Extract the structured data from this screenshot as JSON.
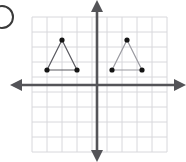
{
  "figure": {
    "kind": "coordinate-plane-with-two-triangles",
    "canvas": {
      "width": 186,
      "height": 162,
      "background": "#ffffff"
    },
    "answer_choice_bubble": {
      "name": "answer-choice-bubble",
      "clipped": true,
      "center_x": 2,
      "center_y": 17,
      "radius": 11,
      "stroke": "#3a3a3a",
      "stroke_width": 2
    },
    "grid": {
      "spacing": 15,
      "left": 32,
      "top": 17,
      "right": 167,
      "bottom": 152,
      "columns": 9,
      "rows": 9,
      "color": "#d8d8dc",
      "stroke_width": 1,
      "visible": true
    },
    "origin": {
      "x": 97,
      "y": 85
    },
    "axes": {
      "color": "#545458",
      "stroke_width": 2.6,
      "x_axis": {
        "name": "x-axis",
        "start_x": 16,
        "end_x": 180,
        "y": 85,
        "arrow_left": true,
        "arrow_right": true
      },
      "y_axis": {
        "name": "y-axis",
        "x": 97,
        "start_y": 6,
        "end_y": 156,
        "arrow_up": true,
        "arrow_down": true
      },
      "arrow_size": 6
    },
    "shapes": [
      {
        "name": "triangle-left",
        "label": "left triangle",
        "stroke": "#5a5a60",
        "stroke_width": 1.2,
        "fill": "none",
        "vertices": [
          {
            "name": "vertex-apex",
            "x": 62,
            "y": 40,
            "grid_x": -2.333,
            "grid_y": 3
          },
          {
            "name": "vertex-base-left",
            "x": 47,
            "y": 70,
            "grid_x": -3.333,
            "grid_y": 1
          },
          {
            "name": "vertex-base-right",
            "x": 77,
            "y": 70,
            "grid_x": -1.333,
            "grid_y": 1
          }
        ]
      },
      {
        "name": "triangle-right",
        "label": "right triangle",
        "stroke": "#9a9aa0",
        "stroke_width": 1.2,
        "fill": "none",
        "vertices": [
          {
            "name": "vertex-apex",
            "x": 127,
            "y": 40,
            "grid_x": 2,
            "grid_y": 3
          },
          {
            "name": "vertex-base-left",
            "x": 112,
            "y": 70,
            "grid_x": 1,
            "grid_y": 1
          },
          {
            "name": "vertex-base-right",
            "x": 142,
            "y": 70,
            "grid_x": 3,
            "grid_y": 1
          }
        ]
      }
    ],
    "vertex_dot": {
      "name": "vertex-dot",
      "radius": 2.6,
      "fill": "#151515"
    }
  }
}
